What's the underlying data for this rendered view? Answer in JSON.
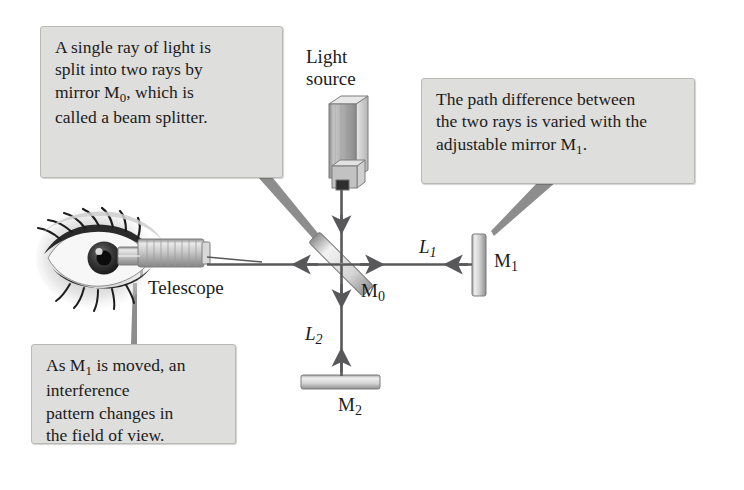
{
  "figure": {
    "title_hidden": "Michelson interferometer schematic",
    "background_color": "#ffffff",
    "ink_color": "#58585a",
    "callout_fill": "#dededc",
    "callout_border": "#b9b9b6"
  },
  "callouts": [
    {
      "id": "beamsplitter",
      "lines": [
        "A single ray of light is",
        "split into two rays by",
        "mirror M0, which is",
        "called a beam splitter."
      ],
      "line1": "A single ray of light is",
      "line2": "split into two rays by",
      "line3a": "mirror M",
      "line3sub": "0",
      "line3b": ", which is",
      "line4": "called a beam splitter."
    },
    {
      "id": "path-difference",
      "line1": "The path difference between",
      "line2": "the two rays is varied with the",
      "line3a": "adjustable mirror M",
      "line3sub": "1",
      "line3b": "."
    },
    {
      "id": "interference",
      "line1a": "As M",
      "line1sub": "1",
      "line1b": " is moved, an",
      "line2": "interference",
      "line3": "pattern changes in",
      "line4": "the field of view."
    }
  ],
  "labels": {
    "light_source_line1": "Light",
    "light_source_line2": "source",
    "telescope": "Telescope",
    "m0": "M",
    "m0_sub": "0",
    "m1": "M",
    "m1_sub": "1",
    "m2": "M",
    "m2_sub": "2",
    "l1": "L",
    "l1_sub": "1",
    "l2": "L",
    "l2_sub": "2"
  }
}
